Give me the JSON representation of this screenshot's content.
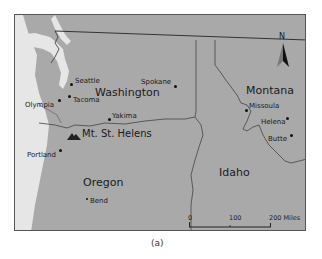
{
  "map": {
    "caption": "(a)",
    "colors": {
      "land": "#a9a9a9",
      "water": "#e8e8e8",
      "border": "#333333",
      "frame": "#555555"
    },
    "north_arrow": {
      "label": "N"
    },
    "states": [
      {
        "name": "Washington"
      },
      {
        "name": "Oregon"
      },
      {
        "name": "Idaho"
      },
      {
        "name": "Montana"
      }
    ],
    "cities": [
      {
        "name": "Seattle"
      },
      {
        "name": "Tacoma"
      },
      {
        "name": "Olympia"
      },
      {
        "name": "Spokane"
      },
      {
        "name": "Yakima"
      },
      {
        "name": "Portland"
      },
      {
        "name": "Bend"
      },
      {
        "name": "Missoula"
      },
      {
        "name": "Helena"
      },
      {
        "name": "Butte"
      }
    ],
    "landmarks": [
      {
        "name": "Mt. St. Helens",
        "icon": "mountain-icon"
      }
    ],
    "scale_bar": {
      "miles": {
        "ticks": [
          "0",
          "100",
          "200 Miles"
        ]
      },
      "kilometers": {
        "ticks": [
          "0",
          "100",
          "200 Kilometers"
        ]
      }
    }
  }
}
